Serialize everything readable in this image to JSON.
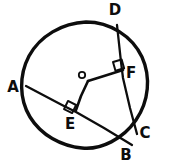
{
  "diagram": {
    "type": "euclidean-geometry",
    "style": "hand-drawn-black-ink",
    "background_color": "#ffffff",
    "ink_color": "#0d0d0d",
    "canvas": {
      "width": 171,
      "height": 164
    },
    "circle": {
      "name": "main-circle",
      "center_label": "O",
      "center": {
        "x": 86,
        "y": 85
      },
      "radius": 63,
      "stroke_width": 3.4
    },
    "points": [
      {
        "id": "A",
        "label": "A",
        "x": 26,
        "y": 86,
        "label_x": 13,
        "label_y": 92,
        "size": "big",
        "on_circle": true,
        "description": "left end of chord AB"
      },
      {
        "id": "B",
        "label": "B",
        "x": 129,
        "y": 143,
        "label_x": 126,
        "label_y": 160,
        "size": "big",
        "on_circle": true,
        "description": "lower-right end of chord AB"
      },
      {
        "id": "C",
        "label": "C",
        "x": 136,
        "y": 132,
        "label_x": 142,
        "label_y": 136,
        "size": "big",
        "on_circle": true,
        "description": "lower end of chord DC"
      },
      {
        "id": "D",
        "label": "D",
        "x": 117,
        "y": 25,
        "label_x": 111,
        "label_y": 15,
        "size": "big",
        "on_circle": true,
        "description": "upper end of chord DC"
      },
      {
        "id": "E",
        "label": "E",
        "x": 75,
        "y": 111,
        "label_x": 66,
        "label_y": 127,
        "size": "big",
        "on_circle": false,
        "description": "foot of perpendicular from O to chord AB"
      },
      {
        "id": "F",
        "label": "F",
        "x": 123,
        "y": 70,
        "label_x": 127,
        "label_y": 76,
        "size": "big",
        "on_circle": false,
        "description": "foot of perpendicular from O to chord DC"
      },
      {
        "id": "O",
        "label": "o",
        "x": 86,
        "y": 80,
        "label_x": 77,
        "label_y": 79,
        "size": "small",
        "on_circle": false,
        "description": "center of the circle"
      }
    ],
    "segments": [
      {
        "id": "AB",
        "name": "chord-ab",
        "from": "A",
        "to": "B",
        "kind": "chord",
        "x1": 26,
        "y1": 86,
        "x2": 132,
        "y2": 145
      },
      {
        "id": "DC",
        "name": "chord-dc",
        "from": "D",
        "to": "C",
        "kind": "chord",
        "x1": 117,
        "y1": 25,
        "x2": 137,
        "y2": 134
      },
      {
        "id": "OF",
        "name": "radius-of",
        "from": "O",
        "to": "F",
        "kind": "perpendicular",
        "x1": 88,
        "y1": 81,
        "x2": 123,
        "y2": 70
      },
      {
        "id": "OE",
        "name": "radius-oe",
        "from": "O",
        "to": "E",
        "kind": "perpendicular",
        "x1": 88,
        "y1": 81,
        "x2": 76,
        "y2": 110
      }
    ],
    "right_angles": [
      {
        "id": "angle-at-F",
        "name": "right-angle-marker-f",
        "at": "F",
        "x": 114,
        "y": 62,
        "size": 9,
        "rotation": -18,
        "description": "OF perpendicular to DC"
      },
      {
        "id": "angle-at-E",
        "name": "right-angle-marker-e",
        "at": "E",
        "x": 69,
        "y": 103,
        "size": 9,
        "rotation": 28,
        "description": "OE perpendicular to AB"
      }
    ],
    "notes": {
      "relationship": "O is the circle center; OE ⟂ AB and OF ⟂ DC",
      "label_count": 7
    }
  }
}
